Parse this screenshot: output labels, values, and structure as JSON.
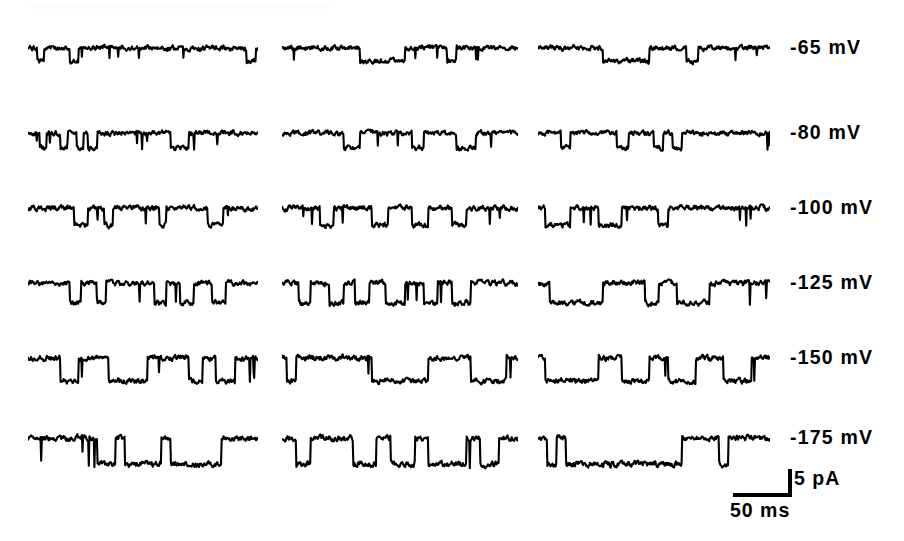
{
  "figure": {
    "type": "electrophysiology-single-channel-traces",
    "width": 904,
    "height": 541,
    "background": "#ffffff",
    "trace_color": "#000000"
  },
  "chart_data": {
    "type": "line",
    "title": "",
    "xlabel": "",
    "ylabel": "",
    "grid": false,
    "legend": "none",
    "x_scale_bar_ms": 50,
    "y_scale_bar_pA": 5,
    "columns": 3,
    "rows": [
      {
        "label": "-65 mV",
        "voltage_mV": -65,
        "y": 48,
        "amplitude_px": 13,
        "noise_px": 2.6,
        "sweeps": [
          {
            "events": [
              [
                0.04,
                0.07,
                1
              ],
              [
                0.18,
                0.22,
                1
              ],
              [
                0.95,
                0.99,
                1
              ]
            ]
          },
          {
            "events": [
              [
                0.33,
                0.52,
                1
              ],
              [
                0.7,
                0.74,
                1
              ]
            ]
          },
          {
            "events": [
              [
                0.28,
                0.48,
                1
              ],
              [
                0.64,
                0.69,
                1
              ]
            ]
          }
        ]
      },
      {
        "label": "-80 mV",
        "voltage_mV": -80,
        "y": 133,
        "amplitude_px": 15,
        "noise_px": 2.6,
        "sweeps": [
          {
            "events": [
              [
                0.05,
                0.08,
                1
              ],
              [
                0.14,
                0.17,
                1
              ],
              [
                0.21,
                0.24,
                1
              ],
              [
                0.26,
                0.3,
                1
              ],
              [
                0.62,
                0.7,
                1
              ]
            ]
          },
          {
            "events": [
              [
                0.26,
                0.33,
                1
              ],
              [
                0.55,
                0.6,
                1
              ],
              [
                0.74,
                0.82,
                1
              ]
            ]
          },
          {
            "events": [
              [
                0.1,
                0.14,
                1
              ],
              [
                0.34,
                0.39,
                1
              ],
              [
                0.5,
                0.54,
                1
              ],
              [
                0.58,
                0.62,
                1
              ]
            ]
          }
        ]
      },
      {
        "label": "-100 mV",
        "voltage_mV": -100,
        "y": 208,
        "amplitude_px": 17,
        "noise_px": 2.7,
        "sweeps": [
          {
            "events": [
              [
                0.2,
                0.26,
                1
              ],
              [
                0.33,
                0.37,
                1
              ],
              [
                0.57,
                0.6,
                1
              ],
              [
                0.78,
                0.85,
                1
              ]
            ]
          },
          {
            "events": [
              [
                0.16,
                0.22,
                1
              ],
              [
                0.38,
                0.45,
                1
              ],
              [
                0.55,
                0.62,
                1
              ],
              [
                0.72,
                0.78,
                1
              ]
            ]
          },
          {
            "events": [
              [
                0.03,
                0.14,
                1
              ],
              [
                0.26,
                0.36,
                1
              ],
              [
                0.52,
                0.56,
                1
              ]
            ]
          }
        ]
      },
      {
        "label": "-125 mV",
        "voltage_mV": -125,
        "y": 283,
        "amplitude_px": 20,
        "noise_px": 2.8,
        "sweeps": [
          {
            "events": [
              [
                0.18,
                0.23,
                1
              ],
              [
                0.3,
                0.34,
                1
              ],
              [
                0.55,
                0.6,
                1
              ],
              [
                0.66,
                0.72,
                1
              ],
              [
                0.8,
                0.86,
                1
              ]
            ]
          },
          {
            "events": [
              [
                0.07,
                0.12,
                1
              ],
              [
                0.2,
                0.26,
                1
              ],
              [
                0.31,
                0.37,
                1
              ],
              [
                0.44,
                0.52,
                1
              ],
              [
                0.6,
                0.66,
                1
              ],
              [
                0.72,
                0.8,
                1
              ]
            ]
          },
          {
            "events": [
              [
                0.05,
                0.28,
                1
              ],
              [
                0.46,
                0.52,
                1
              ],
              [
                0.6,
                0.74,
                1
              ]
            ]
          }
        ]
      },
      {
        "label": "-150 mV",
        "voltage_mV": -150,
        "y": 358,
        "amplitude_px": 23,
        "noise_px": 2.9,
        "sweeps": [
          {
            "events": [
              [
                0.14,
                0.22,
                1
              ],
              [
                0.35,
                0.52,
                1
              ],
              [
                0.7,
                0.76,
                1
              ],
              [
                0.82,
                0.9,
                1
              ]
            ]
          },
          {
            "events": [
              [
                0.02,
                0.06,
                1
              ],
              [
                0.38,
                0.62,
                1
              ],
              [
                0.8,
                0.95,
                1
              ]
            ]
          },
          {
            "events": [
              [
                0.03,
                0.26,
                1
              ],
              [
                0.36,
                0.48,
                1
              ],
              [
                0.56,
                0.68,
                1
              ],
              [
                0.8,
                0.92,
                1
              ]
            ]
          }
        ]
      },
      {
        "label": "-175 mV",
        "voltage_mV": -175,
        "y": 438,
        "amplitude_px": 26,
        "noise_px": 3.0,
        "sweeps": [
          {
            "events": [
              [
                0.3,
                0.38,
                1
              ],
              [
                0.42,
                0.58,
                1
              ],
              [
                0.62,
                0.84,
                1
              ]
            ]
          },
          {
            "events": [
              [
                0.06,
                0.12,
                1
              ],
              [
                0.3,
                0.4,
                1
              ],
              [
                0.46,
                0.56,
                1
              ],
              [
                0.62,
                0.78,
                1
              ],
              [
                0.84,
                0.92,
                1
              ]
            ]
          },
          {
            "events": [
              [
                0.04,
                0.08,
                1
              ],
              [
                0.12,
                0.62,
                1
              ],
              [
                0.78,
                0.82,
                1
              ]
            ]
          }
        ]
      }
    ],
    "column_geometry": [
      {
        "x": 28,
        "width": 230
      },
      {
        "x": 282,
        "width": 236
      },
      {
        "x": 538,
        "width": 232
      }
    ]
  },
  "labels": {
    "rows": [
      "-65 mV",
      "-80 mV",
      "-100 mV",
      "-125 mV",
      "-150 mV",
      "-175 mV"
    ],
    "label_x": 790
  },
  "scale_bar": {
    "current_label": "5 pA",
    "time_label": "50 ms",
    "h_x": 733,
    "h_y": 493,
    "h_width": 55,
    "v_height": 24,
    "thickness": 4
  }
}
